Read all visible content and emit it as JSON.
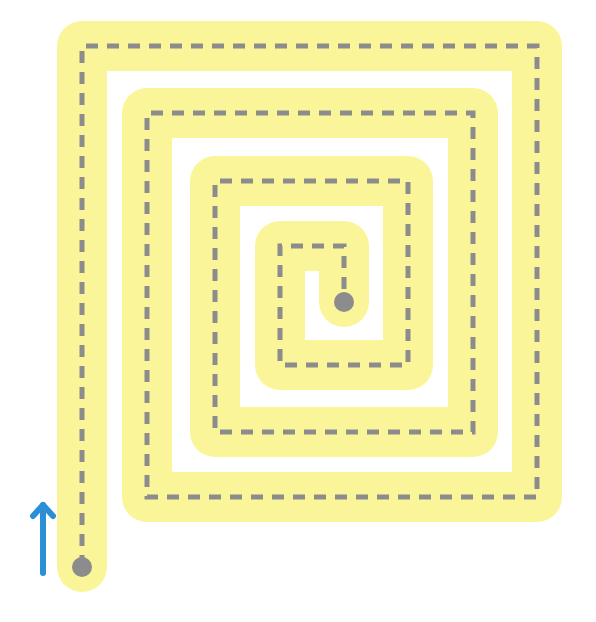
{
  "puzzle": {
    "type": "spiral-maze-trace",
    "colors": {
      "background": "#ffffff",
      "path_band": "#fbf59a",
      "dashed_line": "#8c8c8c",
      "start_dot": "#8c8c8c",
      "end_dot": "#8c8c8c",
      "arrow": "#2b8fd6"
    },
    "path_band_width": 50,
    "dashed_line_width": 5,
    "dash_pattern": [
      12,
      9
    ],
    "path_points": [
      [
        82,
        567
      ],
      [
        82,
        46
      ],
      [
        537,
        46
      ],
      [
        537,
        497
      ],
      [
        147,
        497
      ],
      [
        147,
        113
      ],
      [
        473,
        113
      ],
      [
        473,
        432
      ],
      [
        215,
        432
      ],
      [
        215,
        181
      ],
      [
        408,
        181
      ],
      [
        408,
        365
      ],
      [
        280,
        365
      ],
      [
        280,
        246
      ],
      [
        344,
        246
      ],
      [
        344,
        302
      ]
    ],
    "start_dot": {
      "cx": 82,
      "cy": 567,
      "r": 10
    },
    "end_dot": {
      "cx": 344,
      "cy": 302,
      "r": 10
    },
    "direction_arrow": {
      "icon": "arrow-up-icon",
      "x": 43,
      "y_tail": 573,
      "y_head": 505,
      "head_half_width": 10,
      "head_length": 11
    }
  }
}
